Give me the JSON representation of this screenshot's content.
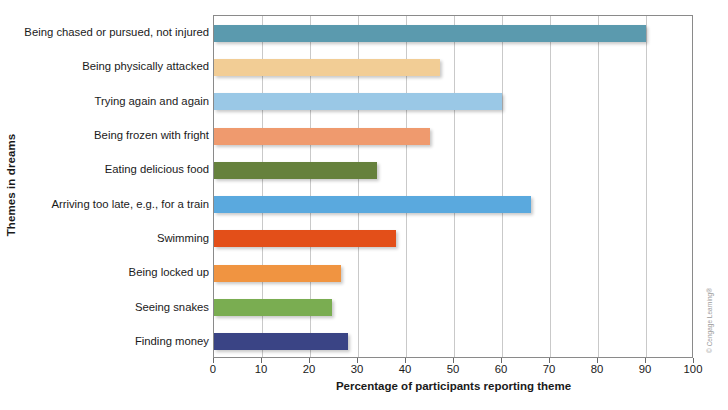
{
  "chart_data": {
    "type": "bar",
    "orientation": "horizontal",
    "title": "",
    "xlabel": "Percentage of participants reporting theme",
    "ylabel": "Themes in dreams",
    "xlim": [
      0,
      100
    ],
    "xticks": [
      0,
      10,
      20,
      30,
      40,
      50,
      60,
      70,
      80,
      90,
      100
    ],
    "grid": "vertical",
    "legend": "none",
    "categories": [
      "Being chased or pursued, not injured",
      "Being physically attacked",
      "Trying again and again",
      "Being frozen with fright",
      "Eating delicious food",
      "Arriving too late, e.g., for a train",
      "Swimming",
      "Being locked up",
      "Seeing snakes",
      "Finding money"
    ],
    "values": [
      90,
      47,
      60,
      45,
      34,
      66,
      38,
      26.5,
      24.5,
      28
    ],
    "colors": [
      "#5b9aae",
      "#f2cd95",
      "#9ac8e6",
      "#ef9a6e",
      "#66813d",
      "#5aa9de",
      "#e34f19",
      "#f09441",
      "#7aad51",
      "#3a4485"
    ]
  },
  "credit": "© Cengage Learning®"
}
